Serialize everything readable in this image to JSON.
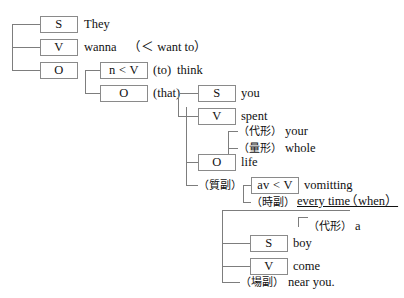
{
  "diagram": {
    "type": "sentence-structure-tree",
    "sentence": "They wanna think that you spent your whole life vomitting every time a boy come near you.",
    "levels": [
      {
        "name": "main-clause",
        "nodes": [
          {
            "tag": "S",
            "word": "They"
          },
          {
            "tag": "V",
            "word": "wanna",
            "note": "(< want to)"
          },
          {
            "tag": "O",
            "word": ""
          }
        ]
      },
      {
        "name": "infinitive-clause",
        "nodes": [
          {
            "tag": "n < V",
            "word": "think",
            "note": "(to)"
          },
          {
            "tag": "O",
            "word": "",
            "note": "(that)"
          }
        ]
      },
      {
        "name": "that-clause",
        "nodes": [
          {
            "tag": "S",
            "word": "you"
          },
          {
            "tag": "V",
            "word": "spent"
          },
          {
            "tag": "O",
            "word": "life"
          }
        ]
      },
      {
        "name": "subordinate-clause",
        "nodes": [
          {
            "tag": "S",
            "word": "boy"
          },
          {
            "tag": "V",
            "word": "come"
          }
        ]
      }
    ]
  },
  "nodes": {
    "s1_tag": "S",
    "s1_word": "They",
    "v1_tag": "V",
    "v1_word": "wanna",
    "v1_note": "（＜ want to）",
    "o1_tag": "O",
    "nv_tag": "n < V",
    "nv_note": "(to)",
    "nv_word": "think",
    "o2_tag": "O",
    "o2_note": "(that)",
    "s2_tag": "S",
    "s2_word": "you",
    "v2_tag": "V",
    "v2_word": "spent",
    "mod_your_tag": "（代形）",
    "mod_your_word": "your",
    "mod_whole_tag": "（量形）",
    "mod_whole_word": "whole",
    "o3_tag": "O",
    "o3_word": "life",
    "adv_quality_tag": "（質副）",
    "avv_tag": "av < V",
    "avv_word": "vomitting",
    "adv_time_tag": "（時副）",
    "adv_time_word": "every time",
    "adv_time_conj": "（when）",
    "mod_a_tag": "（代形）",
    "mod_a_word": "a",
    "s3_tag": "S",
    "s3_word": "boy",
    "v3_tag": "V",
    "v3_word": "come",
    "adv_place_tag": "（場副）",
    "adv_place_word": "near you."
  },
  "colors": {
    "background": "#ffffff",
    "text": "#111111",
    "box_border": "#8a8a8a",
    "connector": "#7d7d7d"
  }
}
